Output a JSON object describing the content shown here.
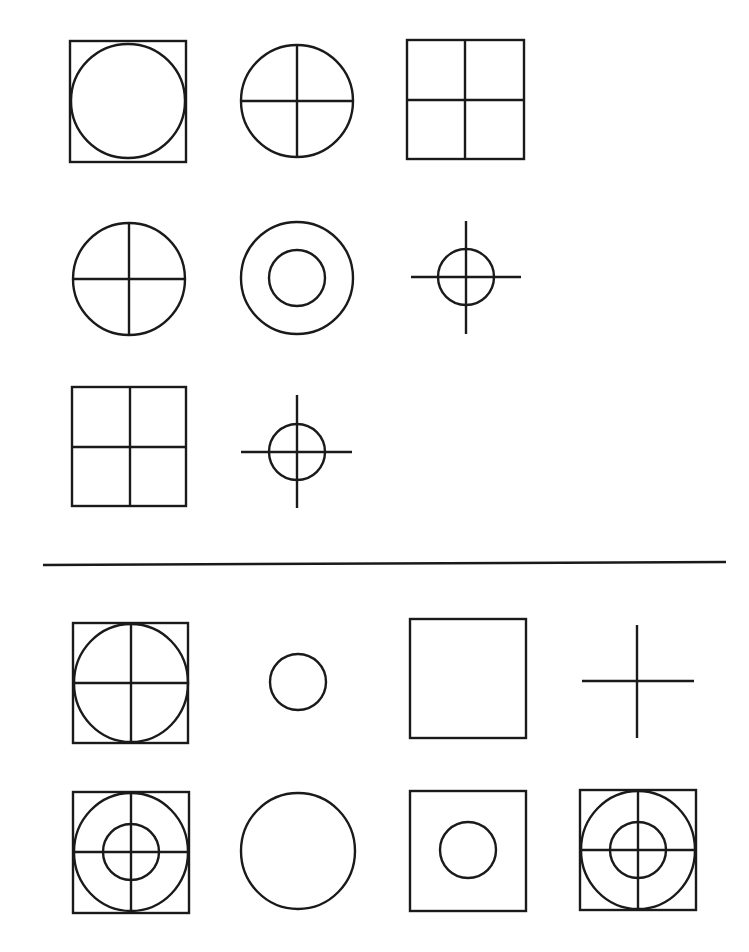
{
  "figure": {
    "type": "figure-series-puzzle",
    "stroke_color": "#1a1a1a",
    "background_color": "#ffffff",
    "question_section": {
      "rows": [
        {
          "shapes": [
            {
              "id": "q1",
              "description": "circle inscribed in square",
              "components": [
                "square",
                "circle"
              ]
            },
            {
              "id": "q2",
              "description": "circle with cross",
              "components": [
                "circle",
                "cross"
              ]
            },
            {
              "id": "q3",
              "description": "square with cross",
              "components": [
                "square",
                "cross"
              ]
            }
          ]
        },
        {
          "shapes": [
            {
              "id": "q4",
              "description": "circle with cross",
              "components": [
                "circle",
                "cross"
              ]
            },
            {
              "id": "q5",
              "description": "two concentric circles",
              "components": [
                "large-circle",
                "small-circle"
              ]
            },
            {
              "id": "q6",
              "description": "small circle with extended cross (crosshair)",
              "components": [
                "small-circle",
                "long-cross"
              ]
            }
          ]
        },
        {
          "shapes": [
            {
              "id": "q7",
              "description": "square with cross",
              "components": [
                "square",
                "cross"
              ]
            },
            {
              "id": "q8",
              "description": "small circle with extended cross (crosshair)",
              "components": [
                "small-circle",
                "long-cross"
              ]
            },
            {
              "id": "q9",
              "description": "missing (to be determined)",
              "components": []
            }
          ]
        }
      ]
    },
    "divider": {
      "present": true
    },
    "options_section": {
      "rows": [
        {
          "shapes": [
            {
              "id": "o1",
              "description": "square with inscribed circle and cross",
              "components": [
                "square",
                "circle",
                "cross"
              ]
            },
            {
              "id": "o2",
              "description": "small circle",
              "components": [
                "small-circle"
              ]
            },
            {
              "id": "o3",
              "description": "empty square",
              "components": [
                "square"
              ]
            },
            {
              "id": "o4",
              "description": "cross / plus sign",
              "components": [
                "long-cross"
              ]
            }
          ]
        },
        {
          "shapes": [
            {
              "id": "o5",
              "description": "square with large circle, small circle and cross",
              "components": [
                "square",
                "large-circle",
                "small-circle",
                "cross"
              ]
            },
            {
              "id": "o6",
              "description": "large circle",
              "components": [
                "large-circle"
              ]
            },
            {
              "id": "o7",
              "description": "square with small circle",
              "components": [
                "square",
                "small-circle"
              ]
            },
            {
              "id": "o8",
              "description": "square with large circle, small circle and cross",
              "components": [
                "square",
                "large-circle",
                "small-circle",
                "cross"
              ]
            }
          ]
        }
      ]
    }
  }
}
